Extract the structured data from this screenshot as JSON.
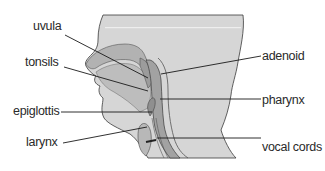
{
  "diagram": {
    "title": "",
    "type": "anatomy-cross-section",
    "colors": {
      "background": "#ffffff",
      "head_fill": "#d6d6d6",
      "head_top_band": "#dcdcdc",
      "airway_fill": "#a9a9a9",
      "airway_dark": "#8a8a8a",
      "outline": "#3a3a3a",
      "leader_line": "#1a1a1a",
      "label_text": "#2a2a2a"
    },
    "labels": {
      "uvula": "uvula",
      "tonsils": "tonsils",
      "epiglottis": "epiglottis",
      "larynx": "larynx",
      "adenoid": "adenoid",
      "pharynx": "pharynx",
      "vocal_cords": "vocal cords"
    },
    "label_order_left": [
      "uvula",
      "tonsils",
      "epiglottis",
      "larynx"
    ],
    "label_order_right": [
      "adenoid",
      "pharynx",
      "vocal cords"
    ]
  }
}
